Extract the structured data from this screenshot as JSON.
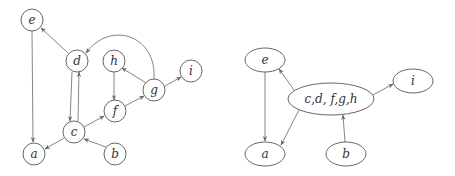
{
  "left_graph": {
    "nodes": [
      {
        "id": "e",
        "label": "e",
        "x": 32,
        "y": 20
      },
      {
        "id": "d",
        "label": "d",
        "x": 77,
        "y": 61
      },
      {
        "id": "h",
        "label": "h",
        "x": 114,
        "y": 61
      },
      {
        "id": "i",
        "label": "i",
        "x": 191,
        "y": 71
      },
      {
        "id": "g",
        "label": "g",
        "x": 154,
        "y": 90
      },
      {
        "id": "f",
        "label": "f",
        "x": 115,
        "y": 111
      },
      {
        "id": "c",
        "label": "c",
        "x": 74,
        "y": 132
      },
      {
        "id": "a",
        "label": "a",
        "x": 34,
        "y": 154
      },
      {
        "id": "b",
        "label": "b",
        "x": 115,
        "y": 154
      }
    ],
    "edges": [
      {
        "from": "e",
        "to": "a"
      },
      {
        "from": "d",
        "to": "e"
      },
      {
        "from": "d",
        "to": "c"
      },
      {
        "from": "c",
        "to": "d"
      },
      {
        "from": "c",
        "to": "a"
      },
      {
        "from": "c",
        "to": "f"
      },
      {
        "from": "b",
        "to": "c"
      },
      {
        "from": "h",
        "to": "f"
      },
      {
        "from": "f",
        "to": "g"
      },
      {
        "from": "g",
        "to": "h"
      },
      {
        "from": "g",
        "to": "i"
      },
      {
        "from": "g",
        "to": "d",
        "curved": true
      }
    ]
  },
  "right_graph": {
    "nodes": [
      {
        "id": "e",
        "label": "e",
        "x": 265,
        "y": 60
      },
      {
        "id": "cdfgh",
        "label": "c,d, f,g,h",
        "x": 331,
        "y": 99
      },
      {
        "id": "i",
        "label": "i",
        "x": 413,
        "y": 81
      },
      {
        "id": "a",
        "label": "a",
        "x": 265,
        "y": 154
      },
      {
        "id": "b",
        "label": "b",
        "x": 346,
        "y": 154
      }
    ],
    "edges": [
      {
        "from": "e",
        "to": "a"
      },
      {
        "from": "cdfgh",
        "to": "e"
      },
      {
        "from": "cdfgh",
        "to": "a"
      },
      {
        "from": "cdfgh",
        "to": "i"
      },
      {
        "from": "b",
        "to": "cdfgh"
      }
    ]
  }
}
